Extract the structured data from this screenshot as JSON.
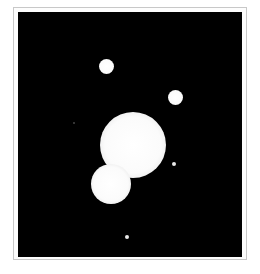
{
  "image": {
    "description": "Telescope image of a bright double body with smaller moons against black sky",
    "background_color": "#000000",
    "frame_color": "#c8c8c8",
    "objects": [
      {
        "name": "primary-body",
        "cx": 132,
        "cy": 146,
        "r": 32
      },
      {
        "name": "secondary-body",
        "cx": 111,
        "cy": 183,
        "r": 19
      },
      {
        "name": "moon-upper-left",
        "cx": 107,
        "cy": 66,
        "r": 7
      },
      {
        "name": "moon-upper-right",
        "cx": 176,
        "cy": 97,
        "r": 7
      },
      {
        "name": "faint-dot-left",
        "cx": 74,
        "cy": 123,
        "r": 1
      },
      {
        "name": "small-dot-right",
        "cx": 174,
        "cy": 164,
        "r": 2
      },
      {
        "name": "small-dot-bottom",
        "cx": 127,
        "cy": 237,
        "r": 2
      }
    ]
  }
}
